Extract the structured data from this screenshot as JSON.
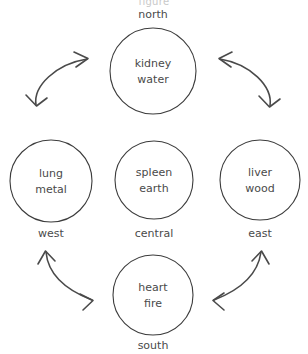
{
  "diagram": {
    "stroke_color": "#3c3c3c",
    "text_color": "#4a4a4a",
    "arrow_color": "#4a4a4a",
    "background_color": "#ffffff",
    "nodes": [
      {
        "id": "north",
        "organ": "kidney",
        "element": "water",
        "direction": "north",
        "direction_position": "above",
        "cx": 153,
        "cy": 71,
        "r": 43
      },
      {
        "id": "west",
        "organ": "lung",
        "element": "metal",
        "direction": "west",
        "direction_position": "below",
        "cx": 51,
        "cy": 181,
        "r": 41
      },
      {
        "id": "central",
        "organ": "spleen",
        "element": "earth",
        "direction": "central",
        "direction_position": "below",
        "cx": 154,
        "cy": 180,
        "r": 39
      },
      {
        "id": "east",
        "organ": "liver",
        "element": "wood",
        "direction": "east",
        "direction_position": "below",
        "cx": 260,
        "cy": 180,
        "r": 40
      },
      {
        "id": "south",
        "organ": "heart",
        "element": "fire",
        "direction": "south",
        "direction_position": "below",
        "cx": 153,
        "cy": 295,
        "r": 40
      }
    ],
    "connections": [
      {
        "id": "northwest",
        "from": "west",
        "to": "north",
        "double_headed": true
      },
      {
        "id": "northeast",
        "from": "east",
        "to": "north",
        "double_headed": true
      },
      {
        "id": "southwest",
        "from": "south",
        "to": "west",
        "double_headed": true
      },
      {
        "id": "southeast",
        "from": "south",
        "to": "east",
        "double_headed": true
      }
    ],
    "top_caption_fragment": "figure"
  }
}
